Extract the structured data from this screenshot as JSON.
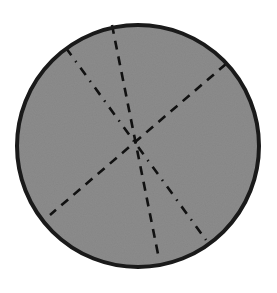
{
  "diagram": {
    "type": "circle-with-symmetry-lines",
    "canvas": {
      "width": 277,
      "height": 293,
      "background": "#ffffff"
    },
    "circle": {
      "cx": 138,
      "cy": 146,
      "r": 121,
      "fill": "#8c8c8c",
      "stroke": "#1a1a1a",
      "stroke_width": 4
    },
    "lines": [
      {
        "id": "line-a",
        "style": "dashed",
        "x1": 112,
        "y1": 25,
        "x2": 158,
        "y2": 254,
        "dasharray": "9,7",
        "color": "#111111",
        "width": 2.6
      },
      {
        "id": "line-b",
        "style": "dashed",
        "x1": 226,
        "y1": 64,
        "x2": 50,
        "y2": 215,
        "dasharray": "9,7",
        "color": "#111111",
        "width": 2.6
      },
      {
        "id": "line-c",
        "style": "dash-dot",
        "x1": 66,
        "y1": 48,
        "x2": 206,
        "y2": 240,
        "dasharray": "9,7,1.5,7",
        "color": "#111111",
        "width": 2.6
      }
    ]
  }
}
